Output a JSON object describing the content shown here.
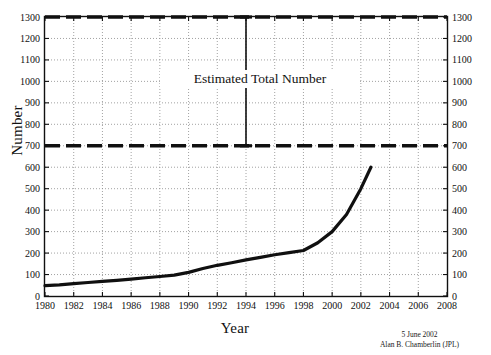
{
  "chart_data": {
    "type": "line",
    "title": "",
    "xlabel": "Year",
    "ylabel": "Number",
    "xlim": [
      1980,
      2008
    ],
    "ylim": [
      0,
      1300
    ],
    "grid": true,
    "legend": "none",
    "x_ticks": [
      1980,
      1982,
      1984,
      1986,
      1988,
      1990,
      1992,
      1994,
      1996,
      1998,
      2000,
      2002,
      2004,
      2006,
      2008
    ],
    "y_ticks": [
      0,
      100,
      200,
      300,
      400,
      500,
      600,
      700,
      800,
      900,
      1000,
      1100,
      1200,
      1300
    ],
    "y_ticks_right": [
      0,
      100,
      200,
      300,
      400,
      500,
      600,
      700,
      800,
      900,
      1000,
      1100,
      1200,
      1300
    ],
    "series": [
      {
        "name": "Known Number",
        "style": "solid",
        "color": "#101010",
        "x": [
          1980,
          1981,
          1982,
          1983,
          1984,
          1985,
          1986,
          1987,
          1988,
          1989,
          1990,
          1991,
          1992,
          1993,
          1994,
          1995,
          1996,
          1997,
          1998,
          1999,
          2000,
          2001,
          2002,
          2002.7
        ],
        "values": [
          48,
          52,
          58,
          63,
          68,
          73,
          79,
          85,
          91,
          97,
          110,
          128,
          143,
          155,
          168,
          180,
          192,
          202,
          212,
          248,
          300,
          380,
          500,
          600
        ]
      }
    ],
    "reference_lines": [
      {
        "name": "upper-estimate",
        "y": 1300,
        "style": "dashed",
        "color": "#101010"
      },
      {
        "name": "lower-estimate",
        "y": 700,
        "style": "dashed",
        "color": "#101010"
      }
    ],
    "annotations": [
      {
        "name": "estimated-total-number",
        "text": "Estimated Total Number",
        "x": 1994,
        "y_from": 700,
        "y_to": 1300,
        "arrow": "double-bar"
      }
    ]
  },
  "axes": {
    "y_label": "Number",
    "x_label": "Year"
  },
  "annotation": {
    "label": "Estimated Total Number"
  },
  "credit": {
    "date": "5 June 2002",
    "author": "Alan B. Chamberlin (JPL)"
  }
}
